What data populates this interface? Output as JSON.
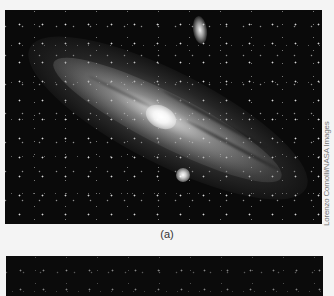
{
  "figure": {
    "panel_a": {
      "label": "(a)",
      "credit": "Lorenzo Comolli/NASA Images",
      "subject": "spiral-galaxy-photo",
      "features": [
        "galaxy-core",
        "companion-galaxy-lower",
        "companion-galaxy-upper",
        "background-stars",
        "dust-lanes"
      ]
    },
    "panel_b": {
      "subject": "starfield-photo"
    }
  }
}
